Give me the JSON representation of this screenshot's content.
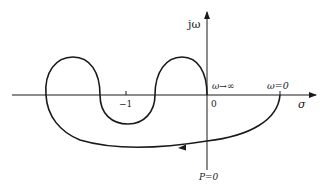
{
  "diagram": {
    "type": "nyquist-plot",
    "axes": {
      "real_label": "σ",
      "imag_label": "jω",
      "origin_label": "0",
      "tick_label": "−1"
    },
    "annotations": {
      "omega_infinity": "ω→∞",
      "omega_zero": "ω=0",
      "open_loop_poles": "P=0"
    },
    "colors": {
      "stroke": "#1a1a1a",
      "background": "#ffffff"
    }
  }
}
